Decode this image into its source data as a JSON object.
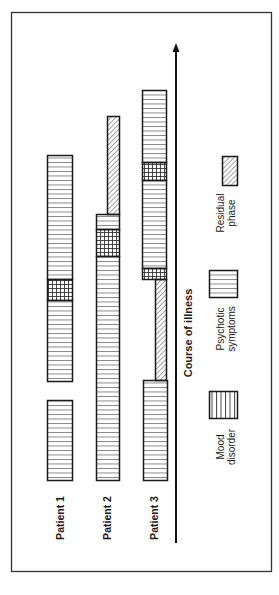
{
  "diagram": {
    "axis_label": "Course of illness",
    "patients": [
      {
        "label": "Patient 1"
      },
      {
        "label": "Patient 2"
      },
      {
        "label": "Patient 3"
      }
    ],
    "legend": [
      {
        "key": "mood",
        "line1": "Mood",
        "line2": "disorder",
        "pattern": "vertical-lines"
      },
      {
        "key": "psychotic",
        "line1": "Psychotic",
        "line2": "symptoms",
        "pattern": "horizontal-lines"
      },
      {
        "key": "residual",
        "line1": "Residual",
        "line2": "phase",
        "pattern": "diagonal-hatch"
      }
    ],
    "colors": {
      "stroke": "#1a1a1a",
      "hatch": "#555555",
      "background": "#ffffff"
    }
  }
}
